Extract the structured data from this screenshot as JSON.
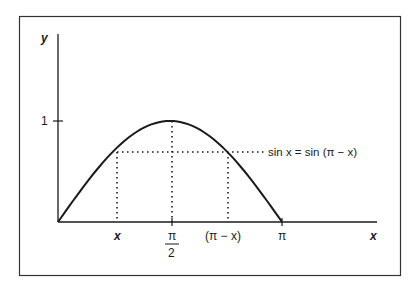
{
  "diagram": {
    "y_axis_label": "y",
    "x_axis_label": "x",
    "y_tick_label": "1",
    "x_ticks": {
      "x": "x",
      "pi_over_2_num": "π",
      "pi_over_2_den": "2",
      "pi_minus_x": "(π − x)",
      "pi": "π"
    },
    "equation": "sin x = sin (π − x)"
  },
  "chart_data": {
    "type": "line",
    "title": "",
    "function": "y = sin x",
    "x": [
      0,
      0.3927,
      0.7854,
      1.1781,
      1.5708,
      1.9635,
      2.3562,
      2.7489,
      3.1416
    ],
    "values": [
      0,
      0.383,
      0.707,
      0.924,
      1.0,
      0.924,
      0.707,
      0.383,
      0
    ],
    "xlabel": "x",
    "ylabel": "y",
    "xlim": [
      0,
      3.6
    ],
    "ylim": [
      0,
      1.5
    ],
    "x_tick_labels": [
      "x",
      "π/2",
      "(π − x)",
      "π"
    ],
    "y_tick_labels": [
      "1"
    ],
    "annotations": [
      "sin x = sin (π − x)"
    ],
    "grid": false,
    "colors": {
      "line": "#1a1a1a",
      "frame": "#333333",
      "background": "#ffffff"
    }
  }
}
